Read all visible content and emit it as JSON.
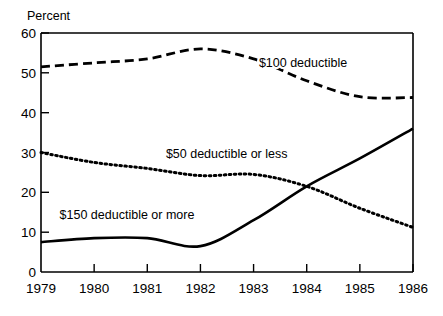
{
  "chart_data": {
    "type": "line",
    "title": "",
    "subtitle": "",
    "xlabel": "",
    "ylabel": "Percent",
    "ylabel_position": "above-axis-top-left",
    "categories": [
      "1979",
      "1980",
      "1981",
      "1982",
      "1983",
      "1984",
      "1985",
      "1986"
    ],
    "x": [
      1979,
      1980,
      1981,
      1982,
      1983,
      1984,
      1985,
      1986
    ],
    "xlim": [
      1979,
      1986
    ],
    "ylim": [
      0,
      60
    ],
    "yticks": [
      0,
      10,
      20,
      30,
      40,
      50,
      60
    ],
    "ytick_labels": [
      "0",
      "10",
      "20",
      "30",
      "40",
      "50",
      "60"
    ],
    "xtick_labels": [
      "1979",
      "1980",
      "1981",
      "1982",
      "1983",
      "1984",
      "1985",
      "1986"
    ],
    "grid": false,
    "legend": "inline-annotations",
    "series": [
      {
        "name": "$100 deductible",
        "style": "dashed",
        "color": "#000000",
        "values": [
          51.5,
          52.5,
          53.5,
          56.0,
          53.5,
          48.0,
          44.0,
          43.8
        ],
        "label": "$100 deductible",
        "label_x": 1983.1,
        "label_y": 51.5
      },
      {
        "name": "$50 deductible or less",
        "style": "dotted",
        "color": "#000000",
        "values": [
          30.0,
          27.5,
          26.0,
          24.2,
          24.5,
          21.5,
          16.0,
          11.2
        ],
        "label": "$50 deductible or less",
        "label_x": 1981.35,
        "label_y": 28.5
      },
      {
        "name": "$150 deductible or more",
        "style": "solid",
        "color": "#000000",
        "values": [
          7.5,
          8.5,
          8.5,
          6.5,
          13.0,
          21.5,
          28.5,
          36.0
        ],
        "label": "$150 deductible or more",
        "label_x": 1979.35,
        "label_y": 13.2
      }
    ],
    "annotations": [
      {
        "text": "$100 deductible",
        "series": "$100 deductible"
      },
      {
        "text": "$50 deductible or less",
        "series": "$50 deductible or less"
      },
      {
        "text": "$150 deductible or more",
        "series": "$150 deductible or more"
      }
    ]
  },
  "axis": {
    "y_axis_title": "Percent"
  }
}
